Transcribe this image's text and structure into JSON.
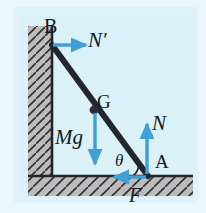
{
  "diagram": {
    "background_color": "#e8f6fa",
    "outer_background_color": "#eaf7fa",
    "wall_color": "#b9b9b9",
    "floor_color": "#b9b9b9",
    "hatch_color": "#2f2f33",
    "rod_color": "#23252f",
    "arrow_color": "#3f9fd6",
    "label_color": "#17181c",
    "labels": {
      "point_b": "B",
      "point_g": "G",
      "point_a": "A",
      "wall_normal": "N′",
      "weight": "Mg",
      "floor_normal": "N",
      "friction": "F",
      "angle": "θ"
    },
    "geometry": {
      "point_b": [
        52,
        45
      ],
      "point_g": [
        93,
        111
      ],
      "point_a": [
        147,
        175
      ],
      "wall_x_inner": 52,
      "floor_y_top": 175,
      "angle_value_deg": 50
    },
    "vectors": [
      {
        "name": "wall-normal-arrow",
        "label": "N′",
        "from": [
          52,
          45
        ],
        "to": [
          88,
          45
        ],
        "direction": "right"
      },
      {
        "name": "weight-arrow",
        "label": "Mg",
        "from": [
          95,
          112
        ],
        "to": [
          95,
          166
        ],
        "direction": "down"
      },
      {
        "name": "floor-normal-arrow",
        "label": "N",
        "from": [
          147,
          174
        ],
        "to": [
          147,
          123
        ],
        "direction": "up"
      },
      {
        "name": "friction-arrow",
        "label": "F",
        "from": [
          147,
          176
        ],
        "to": [
          112,
          176
        ],
        "direction": "left"
      }
    ]
  }
}
